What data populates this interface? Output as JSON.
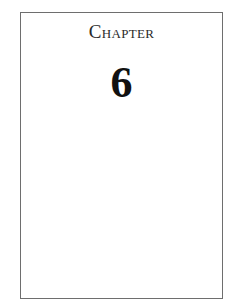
{
  "page": {
    "chapter_label": "Chapter",
    "chapter_number": "6"
  },
  "colors": {
    "border": "#6e6e6e",
    "heading_text": "#2a2a2a",
    "number_text": "#111111",
    "background": "#ffffff"
  }
}
